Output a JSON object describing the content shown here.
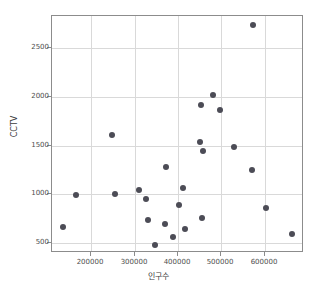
{
  "chart_data": {
    "type": "scatter",
    "title": "",
    "xlabel": "인구수",
    "ylabel": "CCTV",
    "xlim": [
      110000,
      690000
    ],
    "ylim": [
      400,
      2830
    ],
    "grid": true,
    "legend": null,
    "marker": {
      "color": "#4c4c56",
      "size": 6,
      "shape": "circle"
    },
    "xticks": [
      200000,
      300000,
      400000,
      500000,
      600000
    ],
    "xtick_labels": [
      "200000",
      "300000",
      "400000",
      "500000",
      "600000"
    ],
    "yticks": [
      500,
      1000,
      1500,
      2000,
      2500
    ],
    "ytick_labels": [
      "500",
      "1000",
      "1500",
      "2000",
      "2500"
    ],
    "points": [
      {
        "x": 135000,
        "y": 670
      },
      {
        "x": 165000,
        "y": 1000
      },
      {
        "x": 248000,
        "y": 1615
      },
      {
        "x": 255000,
        "y": 1008
      },
      {
        "x": 310000,
        "y": 1050
      },
      {
        "x": 327000,
        "y": 958
      },
      {
        "x": 330000,
        "y": 740
      },
      {
        "x": 348000,
        "y": 485
      },
      {
        "x": 370000,
        "y": 695
      },
      {
        "x": 372000,
        "y": 1280
      },
      {
        "x": 388000,
        "y": 562
      },
      {
        "x": 402000,
        "y": 890
      },
      {
        "x": 412000,
        "y": 1070
      },
      {
        "x": 415000,
        "y": 650
      },
      {
        "x": 450000,
        "y": 1540
      },
      {
        "x": 452000,
        "y": 1920
      },
      {
        "x": 455000,
        "y": 762
      },
      {
        "x": 458000,
        "y": 1450
      },
      {
        "x": 481000,
        "y": 2018
      },
      {
        "x": 497000,
        "y": 1862
      },
      {
        "x": 528000,
        "y": 1485
      },
      {
        "x": 570000,
        "y": 1248
      },
      {
        "x": 572000,
        "y": 2735
      },
      {
        "x": 603000,
        "y": 865
      },
      {
        "x": 662000,
        "y": 595
      }
    ],
    "colors": {
      "marker": "#4c4c56",
      "grid": "#d9d9d9",
      "axis": "#8c8c8c",
      "text": "#4d4d4d",
      "background": "#ffffff"
    }
  }
}
